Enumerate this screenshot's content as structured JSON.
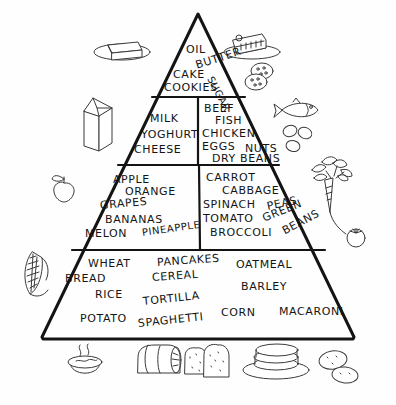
{
  "diagram": {
    "style": "hand-drawn black ink on white",
    "colors": {
      "ink": "#141414",
      "background": "#ffffff",
      "illustration_ink": "#3a3a3a"
    }
  },
  "tiers": [
    {
      "id": "tier-fats-sweets",
      "name": "Fats, Oils and Sweets",
      "position": "apex",
      "sections": [
        {
          "id": "section-fats-sweets",
          "items": [
            {
              "text": "OIL",
              "rotation": 0
            },
            {
              "text": "BUTTER",
              "rotation": -18
            },
            {
              "text": "CAKE",
              "rotation": 0
            },
            {
              "text": "COOKIES",
              "rotation": 0
            },
            {
              "text": "SUGAR",
              "rotation": -62
            }
          ]
        }
      ]
    },
    {
      "id": "tier-dairy-protein",
      "name": "Dairy and Protein",
      "position": "second",
      "sections": [
        {
          "id": "section-dairy",
          "side": "left",
          "items": [
            {
              "text": "MILK",
              "rotation": 0
            },
            {
              "text": "YOGHURT",
              "rotation": 0
            },
            {
              "text": "CHEESE",
              "rotation": 0
            }
          ]
        },
        {
          "id": "section-protein",
          "side": "right",
          "items": [
            {
              "text": "BEEF",
              "rotation": 0
            },
            {
              "text": "FISH",
              "rotation": 0
            },
            {
              "text": "CHICKEN",
              "rotation": 0
            },
            {
              "text": "EGGS",
              "rotation": 0
            },
            {
              "text": "NUTS",
              "rotation": 0
            },
            {
              "text": "DRY BEANS",
              "rotation": 0
            }
          ]
        }
      ]
    },
    {
      "id": "tier-fruit-vegetable",
      "name": "Fruits and Vegetables",
      "position": "third",
      "sections": [
        {
          "id": "section-fruit",
          "side": "left",
          "items": [
            {
              "text": "APPLE",
              "rotation": 0
            },
            {
              "text": "ORANGE",
              "rotation": 0
            },
            {
              "text": "GRAPES",
              "rotation": -5
            },
            {
              "text": "BANANAS",
              "rotation": 0
            },
            {
              "text": "MELON",
              "rotation": 0
            },
            {
              "text": "PINEAPPLE",
              "rotation": -8
            }
          ]
        },
        {
          "id": "section-vegetable",
          "side": "right",
          "items": [
            {
              "text": "CARROT",
              "rotation": 0
            },
            {
              "text": "CABBAGE",
              "rotation": 0
            },
            {
              "text": "SPINACH",
              "rotation": 0
            },
            {
              "text": "PEAS",
              "rotation": -12
            },
            {
              "text": "TOMATO",
              "rotation": 0
            },
            {
              "text": "GREEN",
              "rotation": -22
            },
            {
              "text": "BROCCOLI",
              "rotation": 0
            },
            {
              "text": "BEANS",
              "rotation": -28
            }
          ]
        }
      ]
    },
    {
      "id": "tier-grains",
      "name": "Grains and Starches",
      "position": "base",
      "sections": [
        {
          "id": "section-grains",
          "items": [
            {
              "text": "WHEAT",
              "rotation": 0
            },
            {
              "text": "PANCAKES",
              "rotation": -4
            },
            {
              "text": "OATMEAL",
              "rotation": 0
            },
            {
              "text": "BREAD",
              "rotation": 0
            },
            {
              "text": "CEREAL",
              "rotation": -4
            },
            {
              "text": "BARLEY",
              "rotation": 0
            },
            {
              "text": "RICE",
              "rotation": 0
            },
            {
              "text": "TORTILLA",
              "rotation": -6
            },
            {
              "text": "POTATO",
              "rotation": 0
            },
            {
              "text": "SPAGHETTI",
              "rotation": -6
            },
            {
              "text": "CORN",
              "rotation": 0
            },
            {
              "text": "MACARONI",
              "rotation": 0
            }
          ]
        }
      ]
    }
  ],
  "illustrations": [
    {
      "id": "butter-dish",
      "name": "butter-on-dish-illustration",
      "label": "butter on dish"
    },
    {
      "id": "cake-slice",
      "name": "cake-slice-illustration",
      "label": "slice of cake on plate"
    },
    {
      "id": "cookies",
      "name": "cookies-illustration",
      "label": "cookies"
    },
    {
      "id": "milk-carton",
      "name": "milk-carton-illustration",
      "label": "milk carton"
    },
    {
      "id": "fish",
      "name": "fish-illustration",
      "label": "fish"
    },
    {
      "id": "nuts",
      "name": "nuts-illustration",
      "label": "nuts"
    },
    {
      "id": "apple",
      "name": "apple-illustration",
      "label": "apple"
    },
    {
      "id": "carrot",
      "name": "carrot-illustration",
      "label": "carrot with greens"
    },
    {
      "id": "tomato",
      "name": "tomato-illustration",
      "label": "tomato"
    },
    {
      "id": "corn",
      "name": "corn-illustration",
      "label": "ear of corn"
    },
    {
      "id": "soup-bowl",
      "name": "soup-bowl-illustration",
      "label": "steaming bowl"
    },
    {
      "id": "bread-loaf",
      "name": "bread-loaf-illustration",
      "label": "loaf of bread"
    },
    {
      "id": "bread-slices",
      "name": "bread-slices-illustration",
      "label": "bread slices"
    },
    {
      "id": "pancake-stack",
      "name": "pancake-stack-illustration",
      "label": "stack of pancakes on plate"
    },
    {
      "id": "potatoes",
      "name": "potatoes-illustration",
      "label": "potatoes"
    }
  ]
}
